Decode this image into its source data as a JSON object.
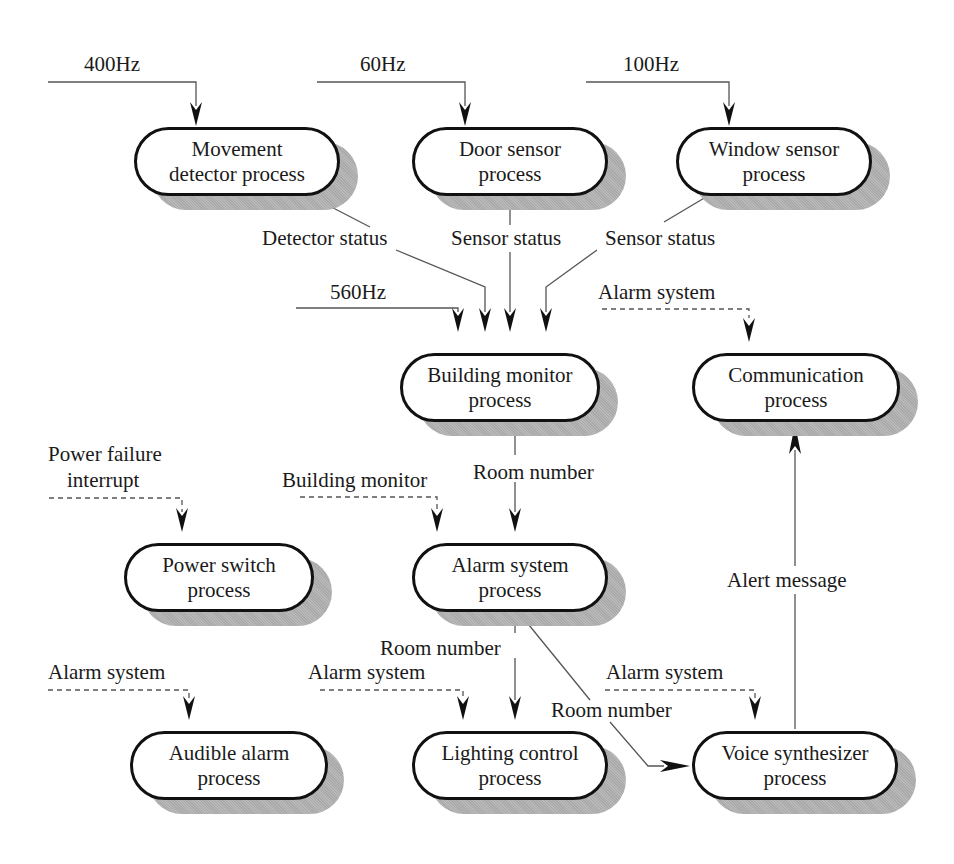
{
  "diagram": {
    "type": "process-diagram",
    "nodes": {
      "movement": "Movement detector process",
      "door": "Door sensor process",
      "window": "Window sensor process",
      "building": "Building monitor process",
      "communication": "Communication process",
      "power": "Power switch process",
      "alarm": "Alarm system process",
      "audible": "Audible alarm process",
      "lighting": "Lighting control process",
      "voice": "Voice synthesizer process"
    },
    "node_lines": {
      "movement": [
        "Movement",
        "detector process"
      ],
      "door": [
        "Door sensor",
        "process"
      ],
      "window": [
        "Window sensor",
        "process"
      ],
      "building": [
        "Building monitor",
        "process"
      ],
      "communication": [
        "Communication",
        "process"
      ],
      "power": [
        "Power switch",
        "process"
      ],
      "alarm": [
        "Alarm system",
        "process"
      ],
      "audible": [
        "Audible alarm",
        "process"
      ],
      "lighting": [
        "Lighting control",
        "process"
      ],
      "voice": [
        "Voice synthesizer",
        "process"
      ]
    },
    "labels": {
      "hz400": "400Hz",
      "hz60": "60Hz",
      "hz100": "100Hz",
      "hz560": "560Hz",
      "detector_status": "Detector status",
      "sensor_status_door": "Sensor status",
      "sensor_status_window": "Sensor status",
      "alarm_system_comm": "Alarm system",
      "power_failure": "Power failure",
      "interrupt": "interrupt",
      "building_monitor": "Building monitor",
      "room_number_bm": "Room number",
      "alert_message": "Alert message",
      "room_number_light": "Room number",
      "alarm_system_audible": "Alarm system",
      "alarm_system_lighting": "Alarm system",
      "alarm_system_voice": "Alarm system",
      "room_number_voice": "Room number"
    },
    "edges": [
      {
        "from": "400Hz timer",
        "to": "movement",
        "style": "solid",
        "label": "400Hz"
      },
      {
        "from": "60Hz timer",
        "to": "door",
        "style": "solid",
        "label": "60Hz"
      },
      {
        "from": "100Hz timer",
        "to": "window",
        "style": "solid",
        "label": "100Hz"
      },
      {
        "from": "movement",
        "to": "building",
        "style": "solid",
        "label": "Detector status"
      },
      {
        "from": "door",
        "to": "building",
        "style": "solid",
        "label": "Sensor status"
      },
      {
        "from": "window",
        "to": "building",
        "style": "solid",
        "label": "Sensor status"
      },
      {
        "from": "560Hz timer",
        "to": "building",
        "style": "solid",
        "label": "560Hz"
      },
      {
        "from": "alarm",
        "to": "communication",
        "style": "dashed",
        "label": "Alarm system"
      },
      {
        "from": "power failure",
        "to": "power",
        "style": "dashed",
        "label": "Power failure interrupt"
      },
      {
        "from": "building",
        "to": "alarm",
        "style": "dashed",
        "label": "Building monitor"
      },
      {
        "from": "building",
        "to": "alarm",
        "style": "solid",
        "label": "Room number"
      },
      {
        "from": "alarm",
        "to": "audible",
        "style": "dashed",
        "label": "Alarm system"
      },
      {
        "from": "alarm",
        "to": "lighting",
        "style": "dashed",
        "label": "Alarm system"
      },
      {
        "from": "alarm",
        "to": "lighting",
        "style": "solid",
        "label": "Room number"
      },
      {
        "from": "alarm",
        "to": "voice",
        "style": "dashed",
        "label": "Alarm system"
      },
      {
        "from": "alarm",
        "to": "voice",
        "style": "solid",
        "label": "Room number"
      },
      {
        "from": "voice",
        "to": "communication",
        "style": "solid",
        "label": "Alert message"
      }
    ],
    "colors": {
      "line": "#555555",
      "border": "#111111",
      "shadow": "#b0b0b0",
      "background": "#ffffff"
    }
  }
}
